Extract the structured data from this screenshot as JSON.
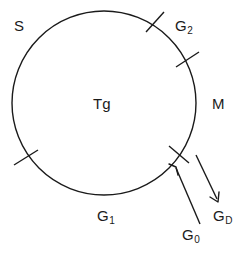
{
  "diagram": {
    "type": "cell-cycle-circle",
    "title": "",
    "stroke_color": "#1a1a1a",
    "background_color": "#ffffff",
    "circle": {
      "center_x": 104,
      "center_y": 103,
      "radius": 92,
      "stroke_width": 1.4
    },
    "center_label": "Tg",
    "phases": [
      {
        "id": "S",
        "label": "S",
        "position": "upper-left"
      },
      {
        "id": "G2",
        "label": "G",
        "subscript": "2",
        "position": "upper-right"
      },
      {
        "id": "M",
        "label": "M",
        "position": "right"
      },
      {
        "id": "G1",
        "label": "G",
        "subscript": "1",
        "position": "bottom"
      }
    ],
    "tick_marks": [
      {
        "id": "tick-g2-start",
        "angle_deg": 305,
        "note": "boundary S / G2"
      },
      {
        "id": "tick-g2-end",
        "angle_deg": 333,
        "note": "boundary G2 / M"
      },
      {
        "id": "tick-m-end",
        "angle_deg": 35,
        "note": "boundary M / G1"
      },
      {
        "id": "tick-s-start",
        "angle_deg": 215,
        "note": "boundary G1 / S"
      }
    ],
    "arrows": [
      {
        "id": "G0",
        "label": "G",
        "subscript": "0",
        "direction": "into-cycle",
        "from_x": 200,
        "from_y": 224,
        "to_x": 175,
        "to_y": 167,
        "note": "quiescent cells re-entering the cycle"
      },
      {
        "id": "GD",
        "label": "G",
        "subscript": "D",
        "direction": "out-of-cycle",
        "from_x": 196,
        "from_y": 155,
        "to_x": 218,
        "to_y": 201,
        "note": "cells exiting the cycle"
      }
    ]
  }
}
